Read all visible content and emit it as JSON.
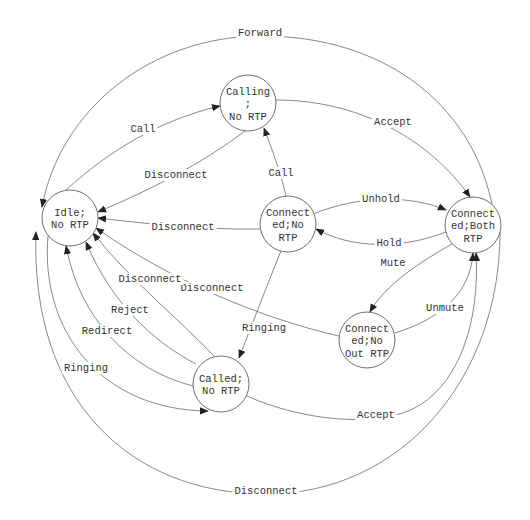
{
  "diagram": {
    "type": "state-machine",
    "colors": {
      "line": "#7a7a7a",
      "text": "#333333",
      "arrow": "#222222",
      "background": "#ffffff"
    },
    "nodes": [
      {
        "id": "idle",
        "lines": [
          "Idle;",
          "No RTP"
        ],
        "cx": 70,
        "cy": 218,
        "r": 28
      },
      {
        "id": "calling",
        "lines": [
          "Calling",
          ";",
          "No RTP"
        ],
        "cx": 248,
        "cy": 103,
        "r": 28
      },
      {
        "id": "connected_no",
        "lines": [
          "Connect",
          "ed;No",
          "RTP"
        ],
        "cx": 288,
        "cy": 224,
        "r": 28
      },
      {
        "id": "connected_both",
        "lines": [
          "Connect",
          "ed;Both",
          "RTP"
        ],
        "cx": 473,
        "cy": 225,
        "r": 28
      },
      {
        "id": "connected_noout",
        "lines": [
          "Connect",
          "ed;No",
          "Out RTP"
        ],
        "cx": 367,
        "cy": 340,
        "r": 28
      },
      {
        "id": "called",
        "lines": [
          "Called;",
          "No RTP"
        ],
        "cx": 221,
        "cy": 384,
        "r": 28
      }
    ],
    "edges": [
      {
        "id": "idle-calling-call",
        "from": "Idle; No RTP",
        "to": "Calling; No RTP",
        "label": "Call",
        "lx": 143,
        "ly": 132
      },
      {
        "id": "calling-idle-disconnect",
        "from": "Calling; No RTP",
        "to": "Idle; No RTP",
        "label": "Disconnect",
        "lx": 176,
        "ly": 178
      },
      {
        "id": "calling-both-accept",
        "from": "Calling; No RTP",
        "to": "Connected;Both RTP",
        "label": "Accept",
        "lx": 393,
        "ly": 125
      },
      {
        "id": "connno-calling-call",
        "from": "Connected;No RTP",
        "to": "Calling; No RTP",
        "label": "Call",
        "lx": 281,
        "ly": 176
      },
      {
        "id": "connno-idle-disconnect",
        "from": "Connected;No RTP",
        "to": "Idle; No RTP",
        "label": "Disconnect",
        "lx": 183,
        "ly": 230
      },
      {
        "id": "connno-both-unhold",
        "from": "Connected;No RTP",
        "to": "Connected;Both RTP",
        "label": "Unhold",
        "lx": 381,
        "ly": 202
      },
      {
        "id": "both-connno-hold",
        "from": "Connected;Both RTP",
        "to": "Connected;No RTP",
        "label": "Hold",
        "lx": 389,
        "ly": 246
      },
      {
        "id": "both-noout-mute",
        "from": "Connected;Both RTP",
        "to": "Connected;No Out RTP",
        "label": "Mute",
        "lx": 393,
        "ly": 266
      },
      {
        "id": "noout-both-unmute",
        "from": "Connected;No Out RTP",
        "to": "Connected;Both RTP",
        "label": "Unmute",
        "lx": 445,
        "ly": 311
      },
      {
        "id": "noout-idle-disconnect",
        "from": "Connected;No Out RTP",
        "to": "Idle; No RTP",
        "label": "Disconnect",
        "lx": 212,
        "ly": 291
      },
      {
        "id": "connno-called-ringing",
        "from": "Connected;No RTP",
        "to": "Called; No RTP",
        "label": "Ringing",
        "lx": 264,
        "ly": 331
      },
      {
        "id": "called-idle-disconnect",
        "from": "Called; No RTP",
        "to": "Idle; No RTP",
        "label": "Disconnect",
        "lx": 150,
        "ly": 282
      },
      {
        "id": "called-idle-reject",
        "from": "Called; No RTP",
        "to": "Idle; No RTP",
        "label": "Reject",
        "lx": 130,
        "ly": 313
      },
      {
        "id": "called-idle-redirect",
        "from": "Called; No RTP",
        "to": "Idle; No RTP",
        "label": "Redirect",
        "lx": 107,
        "ly": 334
      },
      {
        "id": "idle-called-ringing",
        "from": "Idle; No RTP",
        "to": "Called; No RTP",
        "label": "Ringing",
        "lx": 86,
        "ly": 371
      },
      {
        "id": "called-both-accept",
        "from": "Called; No RTP",
        "to": "Connected;Both RTP",
        "label": "Accept",
        "lx": 376,
        "ly": 418
      },
      {
        "id": "both-idle-forward",
        "from": "Connected;Both RTP",
        "to": "Idle; No RTP",
        "label": "Forward",
        "lx": 260,
        "ly": 36
      },
      {
        "id": "both-idle-disconnect",
        "from": "Connected;Both RTP",
        "to": "Idle; No RTP",
        "label": "Disconnect",
        "lx": 266,
        "ly": 494
      }
    ]
  }
}
